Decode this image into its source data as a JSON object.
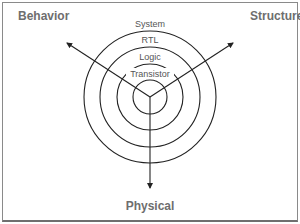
{
  "diagram": {
    "type": "Gajski-Kuhn Y-chart",
    "axes": [
      {
        "id": "behavior",
        "label": "Behavior",
        "direction": "upper-left"
      },
      {
        "id": "structure",
        "label": "Structure",
        "direction": "upper-right"
      },
      {
        "id": "physical",
        "label": "Physical",
        "direction": "down"
      }
    ],
    "levels": [
      {
        "label": "System",
        "ring": 4
      },
      {
        "label": "RTL",
        "ring": 3
      },
      {
        "label": "Logic",
        "ring": 2
      },
      {
        "label": "Transistor",
        "ring": 1
      }
    ],
    "colors": {
      "border": "#8a8a8a",
      "lines": "#222222",
      "axis_label": "#6e6e6e",
      "level_label": "#555555"
    }
  }
}
